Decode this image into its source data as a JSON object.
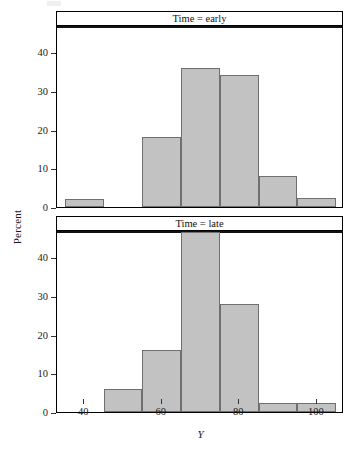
{
  "chart_data": {
    "type": "bar",
    "title": "",
    "subtitle": "",
    "xlabel": "Y",
    "ylabel": "Percent",
    "grid": false,
    "legend": null,
    "layout": "two stacked trellis panels sharing x and y scales",
    "xlim": [
      33,
      107
    ],
    "ylim": [
      0,
      47
    ],
    "xticks": [
      40,
      60,
      80,
      100
    ],
    "yticks": [
      0,
      10,
      20,
      30,
      40
    ],
    "bin_width": 10,
    "panels": [
      {
        "strip_label": "Time = early",
        "bins": [
          {
            "start": 35,
            "end": 45,
            "percent": 2.0
          },
          {
            "start": 45,
            "end": 55,
            "percent": 0.0
          },
          {
            "start": 55,
            "end": 65,
            "percent": 18.0
          },
          {
            "start": 65,
            "end": 75,
            "percent": 36.0
          },
          {
            "start": 75,
            "end": 85,
            "percent": 34.0
          },
          {
            "start": 85,
            "end": 95,
            "percent": 8.0
          },
          {
            "start": 95,
            "end": 105,
            "percent": 2.3
          }
        ]
      },
      {
        "strip_label": "Time = late",
        "bins": [
          {
            "start": 35,
            "end": 45,
            "percent": 0.0
          },
          {
            "start": 45,
            "end": 55,
            "percent": 6.0
          },
          {
            "start": 55,
            "end": 65,
            "percent": 16.0
          },
          {
            "start": 65,
            "end": 75,
            "percent": 46.5
          },
          {
            "start": 75,
            "end": 85,
            "percent": 28.0
          },
          {
            "start": 85,
            "end": 95,
            "percent": 2.2
          },
          {
            "start": 95,
            "end": 105,
            "percent": 2.2
          }
        ]
      }
    ],
    "colors": {
      "bar_fill": "#c2c2c2",
      "bar_stroke": "#6f6f6f",
      "axis": "#333333",
      "panel_border": "#000000",
      "background": "#ffffff"
    }
  }
}
